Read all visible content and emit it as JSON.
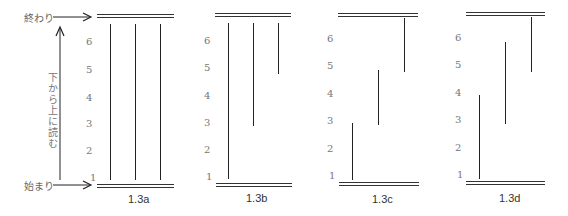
{
  "legend": {
    "end_label": "終わり",
    "start_label": "始まり",
    "direction_label": "下から上に読む"
  },
  "panels": [
    {
      "id": "1.3a",
      "caption": "1.3a",
      "ticks": [
        "1",
        "2",
        "3",
        "4",
        "5",
        "6"
      ],
      "lines": [
        {
          "from": 1,
          "to": 7
        },
        {
          "from": 1,
          "to": 7
        },
        {
          "from": 1,
          "to": 7
        }
      ]
    },
    {
      "id": "1.3b",
      "caption": "1.3b",
      "ticks": [
        "1",
        "2",
        "3",
        "4",
        "5",
        "6"
      ],
      "lines": [
        {
          "from": 1,
          "to": 7
        },
        {
          "from": 3,
          "to": 7
        },
        {
          "from": 5,
          "to": 7
        }
      ]
    },
    {
      "id": "1.3c",
      "caption": "1.3c",
      "ticks": [
        "1",
        "2",
        "3",
        "4",
        "5",
        "6"
      ],
      "lines": [
        {
          "from": 1,
          "to": 3
        },
        {
          "from": 3,
          "to": 5
        },
        {
          "from": 5,
          "to": 7
        }
      ]
    },
    {
      "id": "1.3d",
      "caption": "1.3d",
      "ticks": [
        "1",
        "2",
        "3",
        "4",
        "5",
        "6"
      ],
      "lines": [
        {
          "from": 1,
          "to": 4
        },
        {
          "from": 3,
          "to": 6
        },
        {
          "from": 5,
          "to": 7
        }
      ]
    }
  ]
}
